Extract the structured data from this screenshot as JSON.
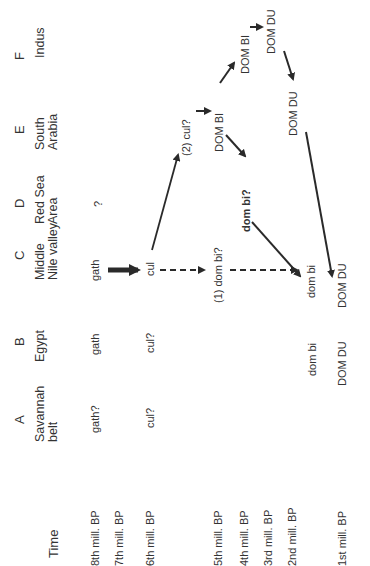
{
  "figure": {
    "orientation": "rotated-90-ccw",
    "time_header": "Time",
    "columns": [
      {
        "letter": "A",
        "name_line1": "Savannah",
        "name_line2": "belt"
      },
      {
        "letter": "B",
        "name_line1": "Egypt",
        "name_line2": ""
      },
      {
        "letter": "C",
        "name_line1": "Middle",
        "name_line2": "Nile valley"
      },
      {
        "letter": "D",
        "name_line1": "Red Sea",
        "name_line2": "Area"
      },
      {
        "letter": "E",
        "name_line1": "South",
        "name_line2": "Arabia"
      },
      {
        "letter": "F",
        "name_line1": "Indus",
        "name_line2": ""
      }
    ],
    "rows": [
      "8th  mill. BP",
      "7th  mill. BP",
      "6th  mill. BP",
      "5th  mill. BP",
      "4th  mill. BP",
      "3rd  mill. BP",
      "2nd mill. BP",
      "1st  mill. BP"
    ],
    "cells": {
      "a_8th": "gath?",
      "a_6th": "cul?",
      "b_8th": "gath",
      "b_6th": "cul?",
      "b_dom_bi": "dom bi",
      "b_dom_du": "DOM  DU",
      "c_8th": "gath",
      "c_cul": "cul",
      "c_dom_bi_q": "(1)  dom bi?",
      "c_dom_bi": "dom bi",
      "c_dom_du": "DOM  DU",
      "d_q": "?",
      "d_dom_bi_q": "dom bi?",
      "e_cul_q": "(2)  cul?",
      "e_dom_bi": "DOM  BI",
      "e_dom_du": "DOM DU",
      "f_dom_bi": "DOM  BI",
      "f_dom_du": "DOM  DU"
    },
    "colors": {
      "text": "#333333",
      "arrow": "#2a2a2a",
      "background": "#ffffff"
    }
  }
}
